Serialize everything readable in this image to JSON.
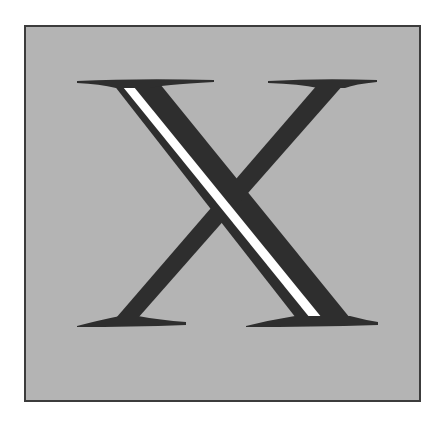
{
  "figure": {
    "letter": "X",
    "colors": {
      "background": "#ffffff",
      "panel": "#b4b4b4",
      "border": "#3c3c3c",
      "glyph": "#2e2e2e",
      "highlight": "#ffffff"
    }
  }
}
